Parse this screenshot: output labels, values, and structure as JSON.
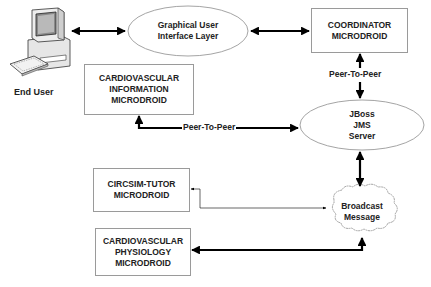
{
  "diagram": {
    "actor": {
      "label": "End User",
      "icon": "desktop-computer-icon"
    },
    "nodes": {
      "gui_layer": {
        "lines": [
          "Graphical User",
          "Interface Layer"
        ],
        "shape": "ellipse"
      },
      "coordinator": {
        "lines": [
          "COORDINATOR",
          "MICRODROID"
        ],
        "shape": "box"
      },
      "cv_information": {
        "lines": [
          "CARDIOVASCULAR",
          "INFORMATION",
          "MICRODROID"
        ],
        "shape": "box"
      },
      "jboss": {
        "lines": [
          "JBoss",
          "JMS",
          "Server"
        ],
        "shape": "ellipse"
      },
      "circsim": {
        "lines": [
          "CIRCSIM-TUTOR",
          "MICRODROID"
        ],
        "shape": "box"
      },
      "broadcast": {
        "lines": [
          "Broadcast",
          "Message"
        ],
        "shape": "cloud"
      },
      "cv_physiology": {
        "lines": [
          "CARDIOVASCULAR",
          "PHYSIOLOGY",
          "MICRODROID"
        ],
        "shape": "box"
      }
    },
    "edges": [
      {
        "from": "End User",
        "to": "Graphical User Interface Layer",
        "direction": "both",
        "label": ""
      },
      {
        "from": "Graphical User Interface Layer",
        "to": "COORDINATOR MICRODROID",
        "direction": "both",
        "label": ""
      },
      {
        "from": "COORDINATOR MICRODROID",
        "to": "JBoss JMS Server",
        "direction": "both",
        "label": "Peer-To-Peer"
      },
      {
        "from": "CARDIOVASCULAR INFORMATION MICRODROID",
        "to": "JBoss JMS Server",
        "direction": "both",
        "label": "Peer-To-Peer"
      },
      {
        "from": "JBoss JMS Server",
        "to": "Broadcast Message",
        "direction": "both",
        "label": ""
      },
      {
        "from": "Broadcast Message",
        "to": "CIRCSIM-TUTOR MICRODROID",
        "direction": "both",
        "label": ""
      },
      {
        "from": "Broadcast Message",
        "to": "CARDIOVASCULAR PHYSIOLOGY MICRODROID",
        "direction": "both",
        "label": ""
      }
    ],
    "edge_labels": {
      "coord_jboss": "Peer-To-Peer",
      "cvinfo_jboss": "Peer-To-Peer"
    },
    "colors": {
      "stroke": "#000000",
      "outline": "#9a9a9a",
      "text": "#222222",
      "background": "#ffffff"
    }
  }
}
